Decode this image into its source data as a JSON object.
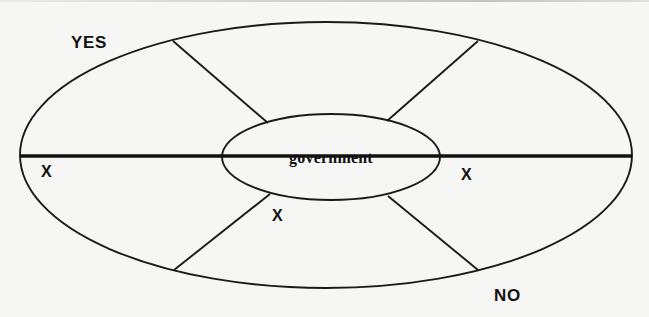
{
  "diagram": {
    "type": "segmented-ellipse-venn",
    "title_text": "",
    "background_color": "#f6f6f4",
    "line_color": "#1a1a1a",
    "center_node": {
      "label": "government",
      "shape": "ellipse",
      "cx": 331,
      "cy": 157,
      "rx": 109,
      "ry": 43,
      "text_x": 331,
      "text_y": 163
    },
    "outer_ring": {
      "shape": "ellipse",
      "cx": 326,
      "cy": 155,
      "rx": 306,
      "ry": 133
    },
    "axis_line": {
      "label": "horizontal-divider",
      "x1": 21,
      "y1": 156,
      "x2": 632,
      "y2": 156,
      "thickness": 3.4
    },
    "spokes": [
      {
        "name": "spoke-upper-left",
        "x1": 173,
        "y1": 41,
        "x2": 268,
        "y2": 123
      },
      {
        "name": "spoke-upper-right",
        "x1": 478,
        "y1": 41,
        "x2": 387,
        "y2": 121
      },
      {
        "name": "spoke-lower-left",
        "x1": 174,
        "y1": 270,
        "x2": 270,
        "y2": 194
      },
      {
        "name": "spoke-lower-right",
        "x1": 478,
        "y1": 270,
        "x2": 388,
        "y2": 196
      }
    ],
    "labels": [
      {
        "name": "label-yes",
        "text": "YES",
        "x": 71,
        "y": 48,
        "style": "label-yes"
      },
      {
        "name": "label-no",
        "text": "NO",
        "x": 494,
        "y": 301,
        "style": "label-no"
      },
      {
        "name": "label-x-left",
        "text": "X",
        "x": 41,
        "y": 177,
        "style": "label-x"
      },
      {
        "name": "label-x-right",
        "text": "X",
        "x": 461,
        "y": 180,
        "style": "label-x"
      },
      {
        "name": "label-x-bottom",
        "text": "X",
        "x": 272,
        "y": 221,
        "style": "label-x"
      }
    ]
  }
}
